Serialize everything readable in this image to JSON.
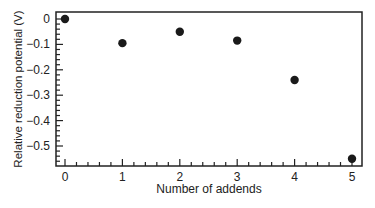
{
  "chart_data": {
    "type": "scatter",
    "title": "",
    "xlabel": "Number of addends",
    "ylabel": "Relative reduction potential (V)",
    "x": [
      0,
      1,
      2,
      3,
      4,
      5
    ],
    "y": [
      0,
      -0.095,
      -0.05,
      -0.085,
      -0.24,
      -0.55
    ],
    "xticks": [
      "0",
      "1",
      "2",
      "3",
      "4",
      "5"
    ],
    "yticks": [
      "0",
      "-0.1",
      "-0.2",
      "-0.3",
      "-0.4",
      "-0.5"
    ],
    "xlim": [
      -0.05,
      5.15
    ],
    "ylim": [
      -0.58,
      0.03
    ],
    "grid": false,
    "legend": null,
    "marker_color": "#1a1a1a"
  }
}
